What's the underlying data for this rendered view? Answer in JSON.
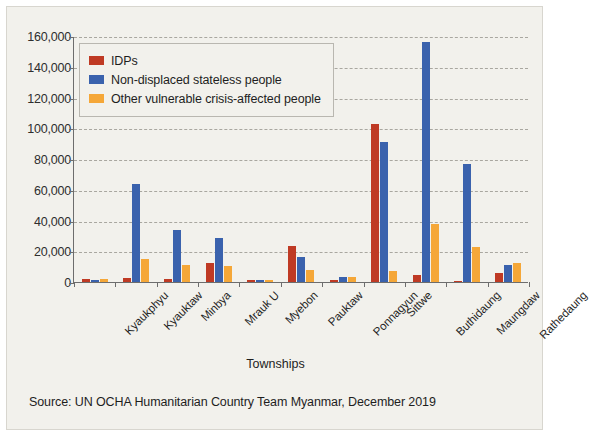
{
  "chart_data": {
    "type": "bar",
    "title": "",
    "xlabel": "Townships",
    "ylabel": "",
    "ylim": [
      0,
      160000
    ],
    "ytick_step": 20000,
    "ytick_labels": [
      "0",
      "20,000",
      "40,000",
      "60,000",
      "80,000",
      "100,000",
      "120,000",
      "140,000",
      "160,000"
    ],
    "grid": true,
    "legend_position": "top-left",
    "categories": [
      "Kyaukphyu",
      "Kyauktaw",
      "Minbya",
      "Mrauk U",
      "Myebon",
      "Pauktaw",
      "Ponnagyun",
      "Sittwe",
      "Buthidaung",
      "Maungdaw",
      "Rathedaung"
    ],
    "series": [
      {
        "name": "IDPs",
        "color": "#bf3a24",
        "values": [
          1800,
          2800,
          2200,
          12500,
          1600,
          23500,
          1000,
          103000,
          4500,
          700,
          6000
        ]
      },
      {
        "name": "Non-displaced stateless people",
        "color": "#3a62ad",
        "values": [
          1200,
          64000,
          34000,
          28500,
          1500,
          16500,
          3500,
          91000,
          156000,
          77000,
          11000
        ]
      },
      {
        "name": "Other vulnerable crisis-affected people",
        "color": "#f5a738",
        "values": [
          2200,
          15000,
          11000,
          10500,
          1300,
          8000,
          3000,
          7000,
          37500,
          23000,
          12500
        ]
      }
    ]
  },
  "legend": {
    "items": [
      {
        "label": "IDPs",
        "color": "#bf3a24"
      },
      {
        "label": "Non-displaced stateless people",
        "color": "#3a62ad"
      },
      {
        "label": "Other vulnerable crisis-affected people",
        "color": "#f5a738"
      }
    ]
  },
  "axis": {
    "x_title": "Townships"
  },
  "source": {
    "text": "Source: UN OCHA Humanitarian Country Team Myanmar, December 2019"
  }
}
